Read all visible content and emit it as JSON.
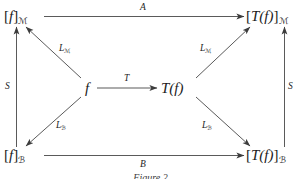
{
  "diagram": {
    "caption": "Figure 2",
    "stroke_color": "#3c3c3c",
    "text_color": "#1b1b1b",
    "background_color": "#ffffff",
    "nodes": [
      {
        "id": "f-A",
        "label": "[f]",
        "subscript": "ℳ",
        "display": "[f]ℳ",
        "position": "top-left"
      },
      {
        "id": "Tf-A",
        "label": "[T(f)]",
        "subscript": "ℳ",
        "display": "[T(f)]ℳ",
        "position": "top-right"
      },
      {
        "id": "f",
        "label": "f",
        "subscript": "",
        "display": "f",
        "position": "center-left"
      },
      {
        "id": "Tf",
        "label": "T(f)",
        "subscript": "",
        "display": "T(f)",
        "position": "center-right"
      },
      {
        "id": "f-B",
        "label": "[f]",
        "subscript": "ℬ",
        "display": "[f]ℬ",
        "position": "bottom-left"
      },
      {
        "id": "Tf-B",
        "label": "[T(f)]",
        "subscript": "ℬ",
        "display": "[T(f)]ℬ",
        "position": "bottom-right"
      }
    ],
    "node_text": {
      "bracket_open": "[",
      "bracket_close": "]",
      "f": "f",
      "Tf": "T(f)",
      "sub_A": "ℳ",
      "sub_B": "ℬ"
    },
    "arrows": [
      {
        "id": "top",
        "label": "A",
        "sub": "",
        "from": "f-A",
        "to": "Tf-A",
        "direction": "right"
      },
      {
        "id": "bottom",
        "label": "B",
        "sub": "",
        "from": "f-B",
        "to": "Tf-B",
        "direction": "right"
      },
      {
        "id": "left-vertical",
        "label": "S",
        "sub": "",
        "from": "f-B",
        "to": "f-A",
        "direction": "up"
      },
      {
        "id": "right-vertical",
        "label": "S",
        "sub": "",
        "from": "Tf-B",
        "to": "Tf-A",
        "direction": "up"
      },
      {
        "id": "center",
        "label": "T",
        "sub": "",
        "from": "f",
        "to": "Tf",
        "direction": "right"
      },
      {
        "id": "upper-left-diagonal",
        "label": "L",
        "sub": "ℳ",
        "from": "f",
        "to": "f-A",
        "direction": "up-left"
      },
      {
        "id": "lower-left-diagonal",
        "label": "L",
        "sub": "ℬ",
        "from": "f",
        "to": "f-B",
        "direction": "down-left"
      },
      {
        "id": "upper-right-diagonal",
        "label": "L",
        "sub": "ℳ",
        "from": "Tf",
        "to": "Tf-A",
        "direction": "up-right"
      },
      {
        "id": "lower-right-diagonal",
        "label": "L",
        "sub": "ℬ",
        "from": "Tf",
        "to": "Tf-B",
        "direction": "down-right"
      }
    ],
    "labels": {
      "top_arrow": "A",
      "bottom_arrow": "B",
      "left_vertical": "S",
      "right_vertical": "S",
      "center_arrow": "T",
      "L": "L"
    }
  }
}
